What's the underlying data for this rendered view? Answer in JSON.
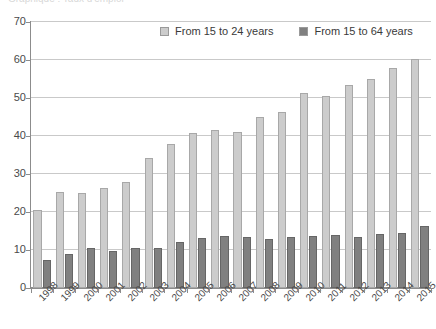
{
  "title_remnant": "Graphique : Taux d'emploi",
  "legend": {
    "position": "top-center",
    "entries": [
      {
        "label": "From 15 to 24 years",
        "color": "#cccccc",
        "swatch": "light"
      },
      {
        "label": "From 15 to 64 years",
        "color": "#808080",
        "swatch": "dark"
      }
    ]
  },
  "chart_data": {
    "type": "bar",
    "title": "",
    "xlabel": "",
    "ylabel": "",
    "ylim": [
      0,
      70
    ],
    "yticks": [
      0,
      10,
      20,
      30,
      40,
      50,
      60,
      70
    ],
    "grid": true,
    "categories": [
      "1998",
      "1999",
      "2000",
      "2001",
      "2002",
      "2003",
      "2004",
      "2005",
      "2006",
      "2007",
      "2008",
      "2009",
      "2010",
      "2011",
      "2012",
      "2013",
      "2014",
      "2015"
    ],
    "series": [
      {
        "name": "From 15 to 24 years",
        "color": "#cccccc",
        "values": [
          20.5,
          25.3,
          25.0,
          26.2,
          27.8,
          34.2,
          37.8,
          40.7,
          41.5,
          41.0,
          45.1,
          46.4,
          51.3,
          50.6,
          53.5,
          55.0,
          57.8,
          60.2
        ]
      },
      {
        "name": "From 15 to 64 years",
        "color": "#808080",
        "values": [
          7.5,
          9.0,
          10.6,
          9.8,
          10.4,
          10.5,
          12.2,
          13.2,
          13.6,
          13.5,
          12.8,
          13.4,
          13.6,
          13.9,
          13.3,
          14.1,
          14.5,
          16.2
        ]
      }
    ]
  }
}
